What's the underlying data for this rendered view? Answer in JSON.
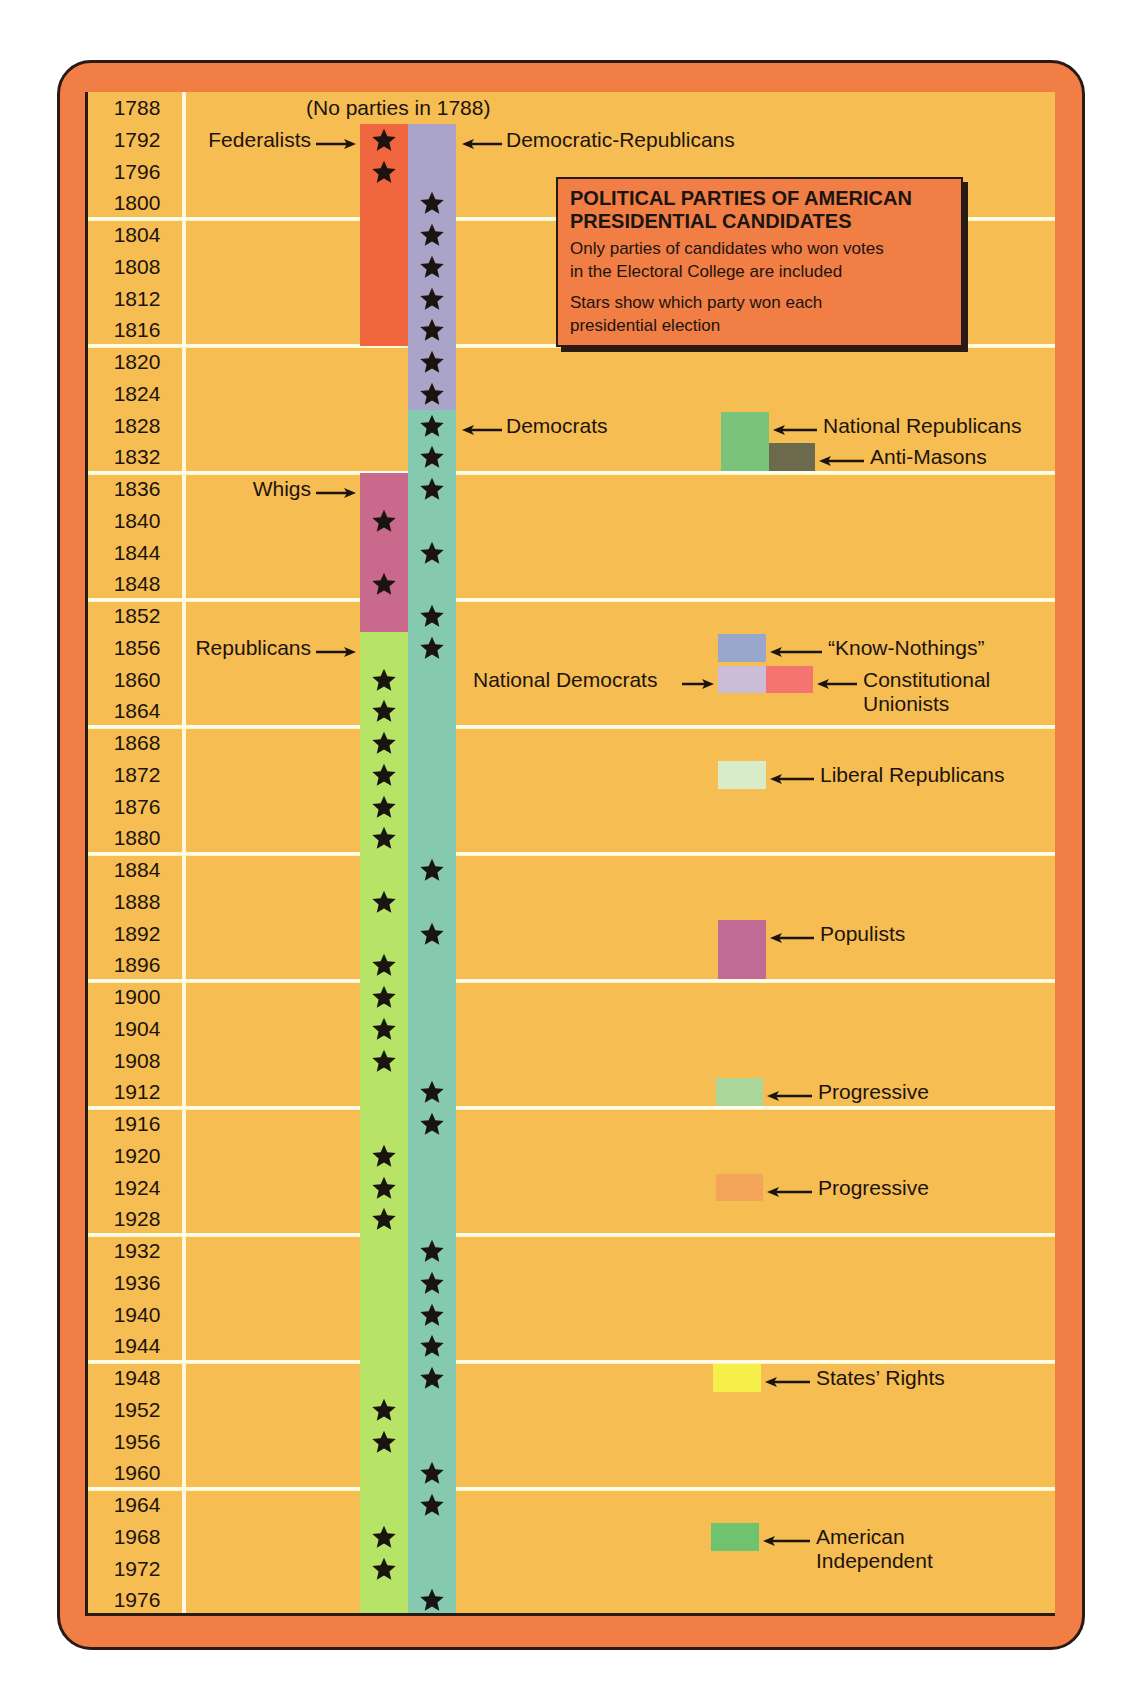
{
  "chart_data": {
    "type": "table",
    "title": "POLITICAL PARTIES OF AMERICAN PRESIDENTIAL CANDIDATES",
    "subtitle": "Only parties of candidates who won votes in the Electoral College are included",
    "note": "Stars show which party won each presidential election",
    "no_parties_note": "(No parties in 1788)",
    "years": [
      1788,
      1792,
      1796,
      1800,
      1804,
      1808,
      1812,
      1816,
      1820,
      1824,
      1828,
      1832,
      1836,
      1840,
      1844,
      1848,
      1852,
      1856,
      1860,
      1864,
      1868,
      1872,
      1876,
      1880,
      1884,
      1888,
      1892,
      1896,
      1900,
      1904,
      1908,
      1912,
      1916,
      1920,
      1924,
      1928,
      1932,
      1936,
      1940,
      1944,
      1948,
      1952,
      1956,
      1960,
      1964,
      1968,
      1972,
      1976
    ],
    "major_parties": [
      {
        "name": "Federalists",
        "color": "#f0673f",
        "column": "left",
        "start": 1792,
        "end": 1816,
        "wins": [
          1792,
          1796
        ],
        "label_side": "left",
        "label_year": 1792
      },
      {
        "name": "Democratic-Republicans",
        "color": "#a9a4c8",
        "column": "right",
        "start": 1792,
        "end": 1824,
        "wins": [
          1800,
          1804,
          1808,
          1812,
          1816,
          1820,
          1824
        ],
        "label_side": "right",
        "label_year": 1792
      },
      {
        "name": "Democrats",
        "color": "#84c9b0",
        "column": "right",
        "start": 1828,
        "end": 1976,
        "wins": [
          1828,
          1832,
          1836,
          1844,
          1852,
          1856,
          1884,
          1892,
          1912,
          1916,
          1932,
          1936,
          1940,
          1944,
          1948,
          1960,
          1964,
          1976
        ],
        "label_side": "right",
        "label_year": 1828
      },
      {
        "name": "Whigs",
        "color": "#c96a8c",
        "column": "left",
        "start": 1836,
        "end": 1852,
        "wins": [
          1840,
          1848
        ],
        "label_side": "left",
        "label_year": 1836
      },
      {
        "name": "Republicans",
        "color": "#b7e366",
        "column": "left",
        "start": 1856,
        "end": 1976,
        "wins": [
          1860,
          1864,
          1868,
          1872,
          1876,
          1880,
          1888,
          1896,
          1900,
          1904,
          1908,
          1920,
          1924,
          1928,
          1952,
          1956,
          1968,
          1972
        ],
        "label_side": "left",
        "label_year": 1856
      }
    ],
    "minor_parties": [
      {
        "name": "National Republicans",
        "color": "#79c47a",
        "start": 1828,
        "end": 1832,
        "x": 718,
        "w": 48,
        "label_x": 820,
        "label_year": 1828
      },
      {
        "name": "Anti-Masons",
        "color": "#6b6a4c",
        "start": 1832,
        "end": 1832,
        "x": 766,
        "w": 46,
        "label_x": 867,
        "label_year": 1832
      },
      {
        "name": "“Know-Nothings”",
        "color": "#9aa7cc",
        "start": 1856,
        "end": 1856,
        "x": 715,
        "w": 48,
        "label_x": 825,
        "label_year": 1856
      },
      {
        "name": "National Democrats",
        "color": "#cbbdd7",
        "start": 1860,
        "end": 1860,
        "x": 715,
        "w": 48,
        "label_x": 470,
        "label_year": 1860,
        "label_side": "left"
      },
      {
        "name": "Constitutional Unionists",
        "color": "#f47470",
        "start": 1860,
        "end": 1860,
        "x": 763,
        "w": 47,
        "label_x": 860,
        "label_year": 1860
      },
      {
        "name": "Liberal Republicans",
        "color": "#d9ecca",
        "start": 1872,
        "end": 1872,
        "x": 715,
        "w": 48,
        "label_x": 817,
        "label_year": 1872
      },
      {
        "name": "Populists",
        "color": "#c06a96",
        "start": 1892,
        "end": 1896,
        "x": 715,
        "w": 48,
        "label_x": 817,
        "label_year": 1892
      },
      {
        "name": "Progressive",
        "color": "#a9d79a",
        "start": 1912,
        "end": 1912,
        "x": 713,
        "w": 47,
        "label_x": 815,
        "label_year": 1912
      },
      {
        "name": "Progressive",
        "color": "#f4a55a",
        "start": 1924,
        "end": 1924,
        "x": 713,
        "w": 47,
        "label_x": 815,
        "label_year": 1924
      },
      {
        "name": "States’ Rights",
        "color": "#f6ef4a",
        "start": 1948,
        "end": 1948,
        "x": 710,
        "w": 48,
        "label_x": 813,
        "label_year": 1948
      },
      {
        "name": "American Independent",
        "color": "#6fc36f",
        "start": 1968,
        "end": 1968,
        "x": 708,
        "w": 48,
        "label_x": 813,
        "label_year": 1968
      }
    ],
    "separators_after": [
      1800,
      1816,
      1832,
      1848,
      1864,
      1880,
      1896,
      1912,
      1928,
      1944,
      1960
    ]
  },
  "legend_labels": {
    "no_parties": "(No parties in 1788)",
    "title_line1": "POLITICAL PARTIES OF AMERICAN",
    "title_line2": "PRESIDENTIAL CANDIDATES",
    "subtitle_line1": "Only parties of candidates who won votes",
    "subtitle_line2": "in the Electoral College  are included",
    "note_line1": "Stars show which party won each",
    "note_line2": "presidential election"
  }
}
